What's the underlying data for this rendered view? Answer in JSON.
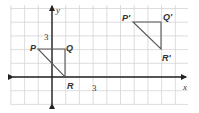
{
  "diagram": {
    "title": "",
    "grid": {
      "left": 11,
      "top": 5,
      "right": 188,
      "bottom": 105,
      "step": 13.7,
      "color": "#d4d4d4"
    },
    "axes": {
      "x_label": "x",
      "y_label": "y",
      "origin_px": [
        52,
        77
      ],
      "color": "#222222"
    },
    "tick_labels": [
      {
        "text": "3",
        "axis": "y",
        "x": 44,
        "y": 40
      },
      {
        "text": "3",
        "axis": "x",
        "x": 92,
        "y": 91
      }
    ],
    "triangles": [
      {
        "name": "PQR",
        "vertices": [
          {
            "label": "P",
            "coord": [
              -1,
              2
            ],
            "px": [
              38,
              49
            ],
            "label_x": 30,
            "label_y": 51
          },
          {
            "label": "Q",
            "coord": [
              1,
              2
            ],
            "px": [
              65,
              49
            ],
            "label_x": 66,
            "label_y": 51
          },
          {
            "label": "R",
            "coord": [
              1,
              0
            ],
            "px": [
              65,
              77
            ],
            "label_x": 67,
            "label_y": 89
          }
        ],
        "color": "#555555"
      },
      {
        "name": "P'Q'R'",
        "vertices": [
          {
            "label": "P'",
            "coord": [
              6,
              4
            ],
            "px": [
              133,
              22
            ],
            "label_x": 122,
            "label_y": 21
          },
          {
            "label": "Q'",
            "coord": [
              8,
              4
            ],
            "px": [
              161,
              22
            ],
            "label_x": 163,
            "label_y": 20
          },
          {
            "label": "R'",
            "coord": [
              8,
              2
            ],
            "px": [
              161,
              49
            ],
            "label_x": 162,
            "label_y": 61
          }
        ],
        "color": "#555555"
      }
    ]
  }
}
